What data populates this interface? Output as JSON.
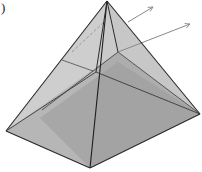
{
  "label": ")",
  "figure": {
    "type": "square-pyramid",
    "vertices": {
      "apex": [
        107,
        1
      ],
      "base_left": [
        6,
        131
      ],
      "base_front": [
        90,
        168
      ],
      "base_right": [
        200,
        114
      ],
      "base_back_hidden": [
        118,
        52
      ]
    },
    "cross_section": {
      "left": [
        62,
        60
      ],
      "back": [
        118,
        76
      ],
      "right": [
        150,
        40
      ]
    },
    "arrows": [
      {
        "from": [
          128,
          22
        ],
        "to": [
          152,
          7
        ]
      },
      {
        "from": [
          118,
          50
        ],
        "to": [
          188,
          23
        ]
      }
    ],
    "colors": {
      "edge": "#2a2a2a",
      "base_face": "#9d9d9d",
      "base_face_dark": "#8f8f8f",
      "left_face": "#c4c4c4",
      "right_face": "#b8b8b8",
      "back_face": "#d8d8d8",
      "arrow": "#8a8a8a",
      "hidden_edge": "#7a7a7a"
    }
  }
}
